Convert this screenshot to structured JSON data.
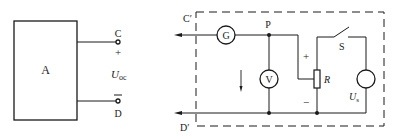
{
  "left_circuit": {
    "network_label": "A",
    "terminal_top": "C",
    "terminal_bottom": "D",
    "plus_sign": "+",
    "minus_sign": "−",
    "voltage_symbol": "U",
    "voltage_subscript": "oc"
  },
  "right_circuit": {
    "terminal_top": "C",
    "terminal_top_prime": "′",
    "terminal_bottom": "D",
    "terminal_bottom_prime": "′",
    "galvanometer": "G",
    "voltmeter": "V",
    "node_label": "P",
    "resistor_label": "R",
    "resistor_plus": "+",
    "resistor_minus": "−",
    "switch_label": "S",
    "source_symbol": "U",
    "source_subscript": "s"
  },
  "colors": {
    "stroke": "#1a1a1a",
    "background": "#ffffff"
  }
}
